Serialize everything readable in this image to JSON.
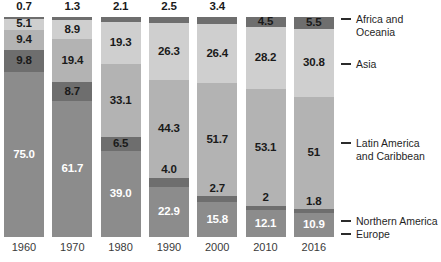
{
  "chart_data": {
    "type": "bar",
    "subtype": "stacked-percentage-column",
    "title": "",
    "subtitle": "",
    "xlabel": "",
    "ylabel": "",
    "ylim": [
      0,
      100
    ],
    "grid": false,
    "legend_position": "right",
    "stack_order_top_to_bottom": [
      "Africa and Oceania",
      "Asia",
      "Latin America and Caribbean",
      "Northern America",
      "Europe"
    ],
    "categories": [
      "1960",
      "1970",
      "1980",
      "1990",
      "2000",
      "2010",
      "2016"
    ],
    "series": [
      {
        "name": "Africa and Oceania",
        "color": "#6e6e6e",
        "values": [
          0.7,
          1.3,
          2.1,
          2.5,
          3.4,
          4.5,
          5.5
        ],
        "labels": [
          "0.7",
          "1.3",
          "2.1",
          "2.5",
          "3.4",
          "4.5",
          "5.5"
        ],
        "label_position": [
          "above",
          "above",
          "above",
          "above",
          "above",
          "inside",
          "inside"
        ]
      },
      {
        "name": "Asia",
        "color": "#cfcfcf",
        "values": [
          5.1,
          8.9,
          19.3,
          26.3,
          26.4,
          28.2,
          30.8
        ],
        "labels": [
          "5.1",
          "8.9",
          "19.3",
          "26.3",
          "26.4",
          "28.2",
          "30.8"
        ],
        "label_position": [
          "inside",
          "inside",
          "inside",
          "inside",
          "inside",
          "inside",
          "inside"
        ]
      },
      {
        "name": "Latin America and Caribbean",
        "color": "#b3b3b3",
        "values": [
          9.4,
          19.4,
          33.1,
          44.3,
          51.7,
          53.1,
          51.0
        ],
        "labels": [
          "9.4",
          "19.4",
          "33.1",
          "44.3",
          "51.7",
          "53.1",
          "51"
        ],
        "label_position": [
          "inside",
          "inside",
          "inside",
          "inside",
          "inside",
          "inside",
          "inside"
        ]
      },
      {
        "name": "Northern America",
        "color": "#6e6e6e",
        "values": [
          9.8,
          8.7,
          6.5,
          4.0,
          2.7,
          2.0,
          1.8
        ],
        "labels": [
          "9.8",
          "8.7",
          "6.5",
          "4.0",
          "2.7",
          "2",
          "1.8"
        ],
        "label_position": [
          "inside",
          "inside",
          "inside",
          "above",
          "above",
          "above",
          "above"
        ]
      },
      {
        "name": "Europe",
        "color": "#8c8c8c",
        "values": [
          75.0,
          61.7,
          39.0,
          22.9,
          15.8,
          12.1,
          10.9
        ],
        "labels": [
          "75.0",
          "61.7",
          "39.0",
          "22.9",
          "15.8",
          "12.1",
          "10.9"
        ],
        "label_position": [
          "inside",
          "inside",
          "inside",
          "inside",
          "inside",
          "inside",
          "inside"
        ]
      }
    ]
  },
  "legend": {
    "items": [
      {
        "label": "Africa and Oceania"
      },
      {
        "label": "Asia"
      },
      {
        "label": "Latin America\nand Caribbean"
      },
      {
        "label": "Northern America"
      },
      {
        "label": "Europe"
      }
    ]
  },
  "axis": {
    "categories": [
      "1960",
      "1970",
      "1980",
      "1990",
      "2000",
      "2010",
      "2016"
    ]
  },
  "colors": {
    "africa_oceania": "#6e6e6e",
    "asia": "#cfcfcf",
    "latin_america": "#b3b3b3",
    "northern_america": "#6e6e6e",
    "europe": "#8c8c8c",
    "label_dark": "#1a1a1a",
    "label_light": "#ffffff",
    "background": "#ffffff"
  }
}
